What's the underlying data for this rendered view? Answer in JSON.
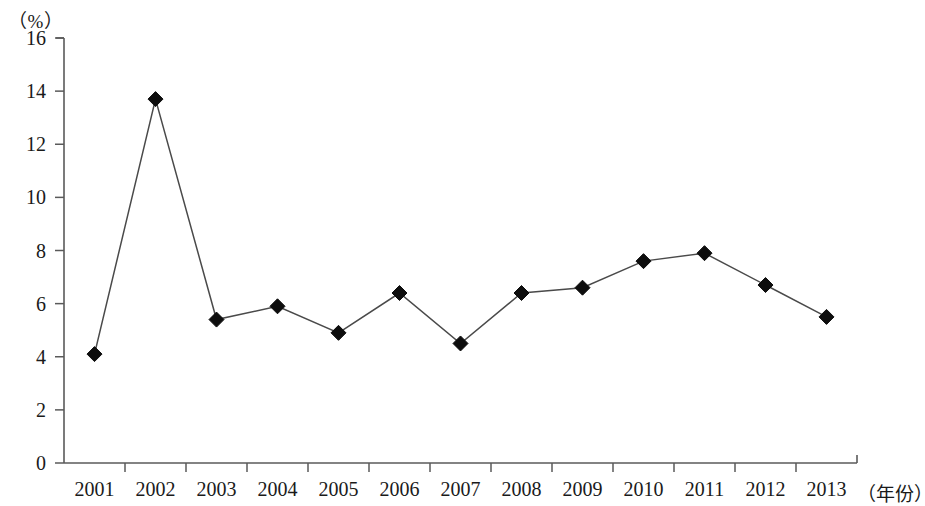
{
  "chart_data": {
    "type": "line",
    "title": "",
    "subtitle": "",
    "xlabel": "（年份）",
    "ylabel": "（%）",
    "categories": [
      "2001",
      "2002",
      "2003",
      "2004",
      "2005",
      "2006",
      "2007",
      "2008",
      "2009",
      "2010",
      "2011",
      "2012",
      "2013"
    ],
    "values": [
      4.1,
      13.7,
      5.4,
      5.9,
      4.9,
      6.4,
      4.5,
      6.4,
      6.6,
      7.6,
      7.9,
      6.7,
      5.5
    ],
    "series": [
      {
        "name": "",
        "values": [
          4.1,
          13.7,
          5.4,
          5.9,
          4.9,
          6.4,
          4.5,
          6.4,
          6.6,
          7.6,
          7.9,
          6.7,
          5.5
        ]
      }
    ],
    "ylim": [
      0,
      16
    ],
    "ytick_labels": [
      "0",
      "2",
      "4",
      "6",
      "8",
      "10",
      "12",
      "14",
      "16"
    ],
    "ytick_values": [
      0,
      2,
      4,
      6,
      8,
      10,
      12,
      14,
      16
    ],
    "grid": false,
    "legend": null,
    "legend_position": "none",
    "marker": "diamond",
    "line_color": "#4a4a4a",
    "marker_color": "#0d0d0d",
    "axis_color": "#5a5a5a",
    "background_color": "#ffffff"
  }
}
